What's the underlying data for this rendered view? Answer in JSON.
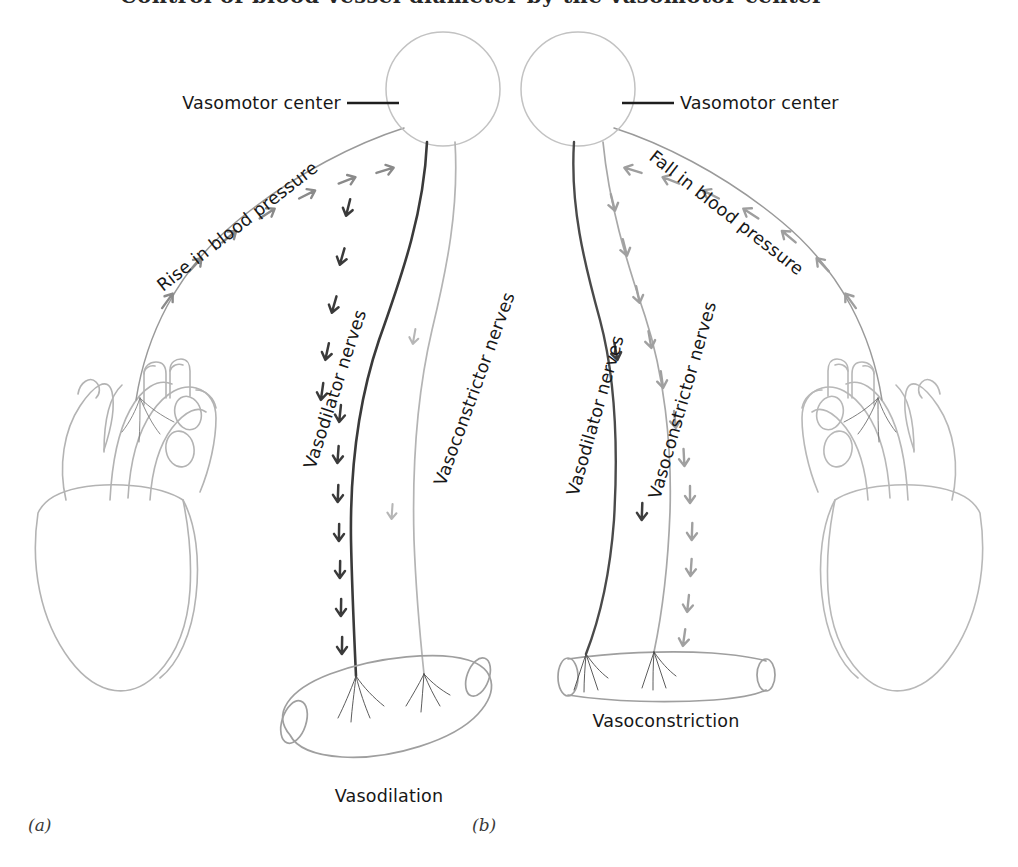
{
  "figure": {
    "clipped_header_text": "Control of blood vessel diameter by the vasomotor center",
    "background_color": "#ffffff",
    "ink_dark": "#2b2b2b",
    "ink_mid": "#6f6f6f",
    "ink_light": "#a9a9a9",
    "ink_faint": "#bdbdbd"
  },
  "panels": [
    {
      "id": "a",
      "id_label": "(a)",
      "center_label": "Vasomotor center",
      "afferent_label": "Rise in blood pressure",
      "afferent_direction": "toward-center",
      "nerves": [
        {
          "name": "vasodilator",
          "label": "Vasodilator nerves",
          "state": "active",
          "color": "#3a3a3a",
          "arrow_count": 12
        },
        {
          "name": "vasoconstrictor",
          "label": "Vasoconstrictor nerves",
          "state": "inactive",
          "color": "#b0b0b0",
          "arrow_count": 2
        }
      ],
      "effector_label": "Vasodilation",
      "effector_shape": "dilated-vessel",
      "organ": "heart"
    },
    {
      "id": "b",
      "id_label": "(b)",
      "center_label": "Vasomotor center",
      "afferent_label": "Fall in blood pressure",
      "afferent_direction": "toward-center",
      "nerves": [
        {
          "name": "vasodilator",
          "label": "Vasodilator nerves",
          "state": "inactive",
          "color": "#4a4a4a",
          "arrow_count": 2
        },
        {
          "name": "vasoconstrictor",
          "label": "Vasoconstrictor nerves",
          "state": "active",
          "color": "#9a9a9a",
          "arrow_count": 12
        }
      ],
      "effector_label": "Vasoconstriction",
      "effector_shape": "constricted-vessel",
      "organ": "heart"
    }
  ]
}
